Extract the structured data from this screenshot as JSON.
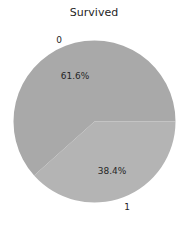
{
  "chart_data": {
    "type": "pie",
    "title": "Survived",
    "categories": [
      "0",
      "1"
    ],
    "values": [
      61.6,
      38.4
    ],
    "autopct_labels": [
      "61.6%",
      "38.4%"
    ],
    "colors": [
      "#a9a9a9",
      "#b4b4b4"
    ],
    "start_angle_deg": 0,
    "direction": "counterclockwise",
    "legend": false,
    "xlabel": "",
    "ylabel": ""
  }
}
